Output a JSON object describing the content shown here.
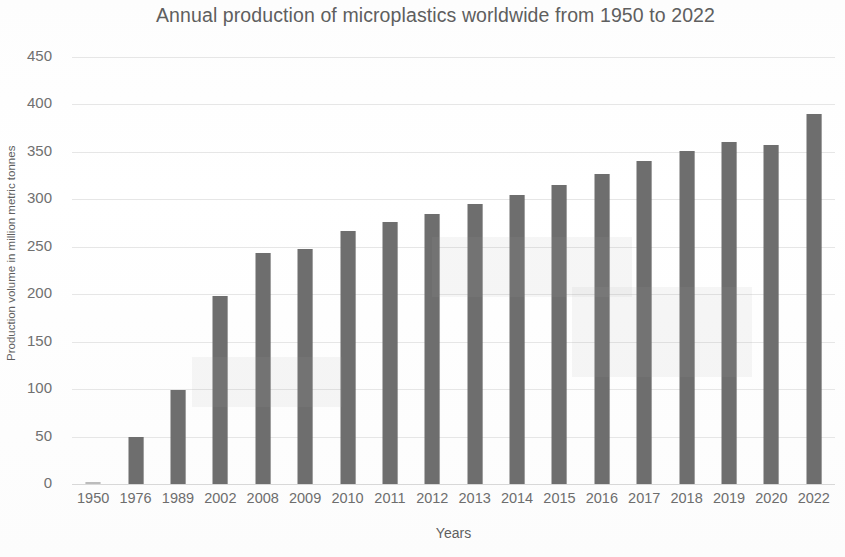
{
  "chart_data": {
    "type": "bar",
    "title": "Annual production of microplastics worldwide from 1950 to 2022",
    "xlabel": "Years",
    "ylabel": "Production volume in million metric tonnes",
    "categories": [
      "1950",
      "1976",
      "1989",
      "2002",
      "2008",
      "2009",
      "2010",
      "2011",
      "2012",
      "2013",
      "2014",
      "2015",
      "2016",
      "2017",
      "2018",
      "2019",
      "2020",
      "2022"
    ],
    "values": [
      2,
      50,
      99,
      198,
      243,
      248,
      267,
      276,
      285,
      295,
      305,
      315,
      327,
      340,
      351,
      360,
      357,
      390
    ],
    "series": [
      {
        "name": "Production volume",
        "values": [
          2,
          50,
          99,
          198,
          243,
          248,
          267,
          276,
          285,
          295,
          305,
          315,
          327,
          340,
          351,
          360,
          357,
          390
        ]
      }
    ],
    "ylim": [
      0,
      450
    ],
    "yticks": [
      0,
      50,
      100,
      150,
      200,
      250,
      300,
      350,
      400,
      450
    ],
    "ytick_labels": [
      "0",
      "50",
      "100",
      "150",
      "200",
      "250",
      "300",
      "350",
      "400",
      "450"
    ],
    "grid": true,
    "grid_axis": "y",
    "legend": false,
    "legend_position": "none",
    "bar_color": "#6e6e6e",
    "background_color": "#ffffff",
    "gridline_color": "#e6e6e6",
    "text_color": "#6b6b6b"
  }
}
